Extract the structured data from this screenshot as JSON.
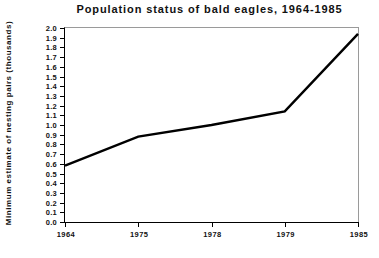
{
  "chart_data": {
    "type": "line",
    "title": "Population status of bald eagles, 1964-1985",
    "xlabel": "",
    "ylabel": "Minimum estimate of nesting pairs (thousands)",
    "categories": [
      "1964",
      "1975",
      "1978",
      "1979",
      "1985"
    ],
    "x_tick_labels": [
      "1964",
      "1975",
      "1978",
      "1979",
      "1985"
    ],
    "y_tick_labels": [
      "2.0",
      "1.9",
      "1.8",
      "1.7",
      "1.6",
      "1.5",
      "1.4",
      "1.3",
      "1.2",
      "1.1",
      "1.0",
      "0.9",
      "0.8",
      "0.7",
      "0.6",
      "0.5",
      "0.4",
      "0.3",
      "0.2",
      "0.1",
      "0.0"
    ],
    "y_tick_values": [
      2.0,
      1.9,
      1.8,
      1.7,
      1.6,
      1.5,
      1.4,
      1.3,
      1.2,
      1.1,
      1.0,
      0.9,
      0.8,
      0.7,
      0.6,
      0.5,
      0.4,
      0.3,
      0.2,
      0.1,
      0.0
    ],
    "ylim": [
      0.0,
      2.0
    ],
    "grid": false,
    "legend": false,
    "legend_position": "none",
    "series": [
      {
        "name": "Minimum estimate of nesting pairs",
        "values": [
          0.58,
          0.88,
          1.0,
          1.14,
          1.94
        ],
        "color": "#000000",
        "line_width": 2.4
      }
    ],
    "annotations": []
  }
}
